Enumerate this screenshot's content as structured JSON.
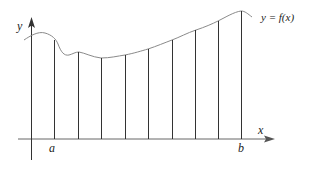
{
  "diagram": {
    "labels": {
      "y_axis": "y",
      "x_axis": "x",
      "curve": "y = f(x)",
      "left_bound": "a",
      "right_bound": "b"
    },
    "partition": {
      "subintervals": 8,
      "description": "interval [a, b] divided into 8 equal subintervals with vertical lines up to the curve"
    },
    "colors": {
      "curve": "#8a8a8a",
      "lines": "#333333",
      "axes": "#555555",
      "text": "#222222"
    }
  }
}
